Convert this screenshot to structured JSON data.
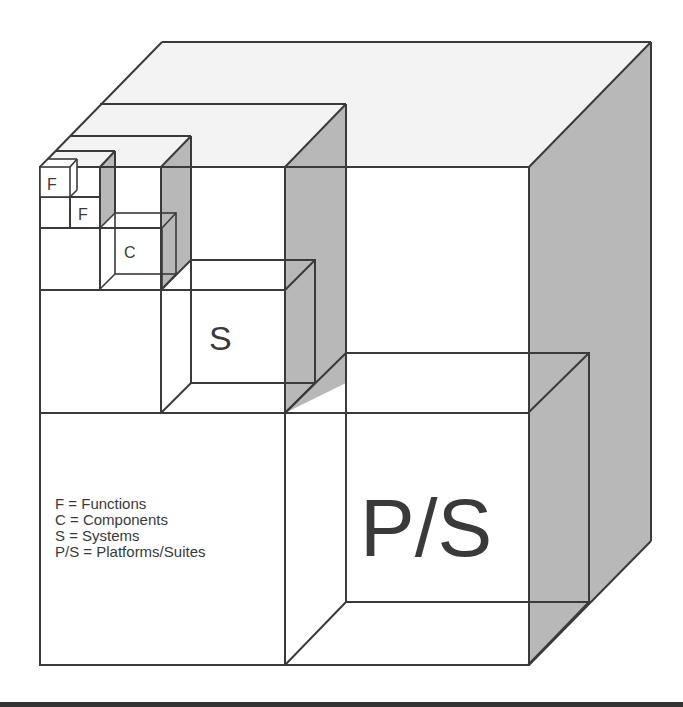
{
  "diagram": {
    "type": "nested-cubes",
    "cube_labels": {
      "function_1": "F",
      "function_2": "F",
      "component": "C",
      "system": "S",
      "platform_suite": "P/S"
    },
    "legend": [
      {
        "abbr": "F",
        "text": "F = Functions"
      },
      {
        "abbr": "C",
        "text": "C = Components"
      },
      {
        "abbr": "S",
        "text": "S = Systems"
      },
      {
        "abbr": "P/S",
        "text": "P/S = Platforms/Suites"
      }
    ],
    "colors": {
      "line": "#3a3a3a",
      "shade": "#b8b8b8",
      "top_face": "#f3f3f3",
      "background": "#ffffff"
    }
  }
}
